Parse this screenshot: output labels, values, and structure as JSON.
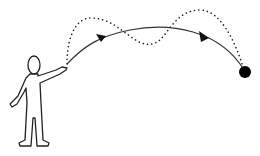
{
  "diagram": {
    "colors": {
      "line": "#222222",
      "fill": "#ffffff",
      "dot": "#000000"
    },
    "elements": [
      {
        "name": "person-figure"
      },
      {
        "name": "solid-trajectory",
        "arrows": 2
      },
      {
        "name": "dotted-trajectory"
      },
      {
        "name": "target-dot"
      }
    ]
  }
}
